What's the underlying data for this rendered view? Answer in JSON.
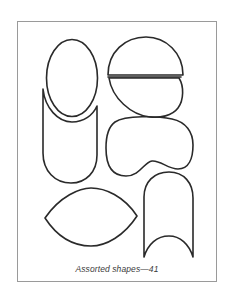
{
  "figure": {
    "caption": "Assorted shapes—41",
    "frame_color": "#9a9a9a",
    "stroke_color": "#2a2a2a",
    "shapes": [
      {
        "name": "oval",
        "label": "Oval"
      },
      {
        "name": "u-shape-concave-top",
        "label": "Rounded-bottom shape with concave top"
      },
      {
        "name": "semicircle",
        "label": "Semicircle"
      },
      {
        "name": "half-ellipse",
        "label": "Half ellipse"
      },
      {
        "name": "mask-shape",
        "label": "Goggle/mask shape"
      },
      {
        "name": "lens-shape",
        "label": "Lens (vesica) shape"
      },
      {
        "name": "arch-concave-bottom",
        "label": "Arch with concave bottom"
      }
    ]
  }
}
